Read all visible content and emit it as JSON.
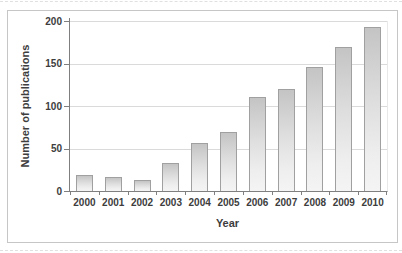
{
  "chart_data": {
    "type": "bar",
    "title": "",
    "xlabel": "Year",
    "ylabel": "Number of publications",
    "categories": [
      "2000",
      "2001",
      "2002",
      "2003",
      "2004",
      "2005",
      "2006",
      "2007",
      "2008",
      "2009",
      "2010"
    ],
    "values": [
      19,
      16,
      13,
      33,
      57,
      69,
      111,
      120,
      146,
      170,
      193
    ],
    "ylim": [
      0,
      200
    ],
    "yticks": [
      0,
      50,
      100,
      150,
      200
    ],
    "grid": true,
    "legend": false,
    "colors": {
      "bar_fill_top": "#c4c4c4",
      "bar_fill_bottom": "#f4f4f4",
      "bar_border": "#a0a0a0",
      "gridline": "#dadada",
      "axis": "#7f7f7f",
      "text": "#3d3d3d",
      "frame_border": "#c6c6c6"
    }
  }
}
